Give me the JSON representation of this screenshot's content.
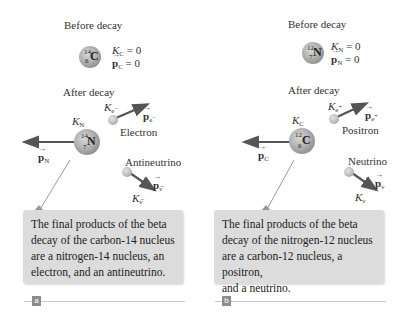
{
  "panels": [
    {
      "id": "a",
      "badge": "a",
      "before": {
        "heading": "Before decay",
        "nucleus": {
          "mass": "14",
          "z": "6",
          "element": "C"
        },
        "kinetic_symbol": "K",
        "kinetic_sub": "C",
        "kinetic_value": "= 0",
        "momentum_symbol": "p",
        "momentum_sub": "C",
        "momentum_value": "= 0"
      },
      "after": {
        "heading": "After decay",
        "nucleus": {
          "mass": "14",
          "z": "7",
          "element": "N"
        },
        "nucleus_kinetic": {
          "sym": "K",
          "sub": "N"
        },
        "nucleus_momentum": {
          "sym": "p",
          "sub": "N"
        },
        "particle1": {
          "name": "Electron",
          "kinetic": {
            "sym": "K",
            "sub": "e",
            "sup": "−"
          },
          "momentum": {
            "sym": "p",
            "sub": "e",
            "sup": "−"
          }
        },
        "particle2": {
          "name": "Antineutrino",
          "kinetic": {
            "sym": "K",
            "sub": "ν̅"
          },
          "momentum": {
            "sym": "p",
            "sub": "ν̅"
          }
        }
      },
      "caption": "The final products of the beta decay of the carbon-14 nucleus are a nitrogen-14 nucleus, an electron, and an antineutrino.",
      "caption_lines": [
        "The final products of the beta",
        "decay of the carbon-14 nucleus",
        "are a nitrogen-14 nucleus, an",
        "electron, and an antineutrino."
      ]
    },
    {
      "id": "b",
      "badge": "b",
      "before": {
        "heading": "Before decay",
        "nucleus": {
          "mass": "12",
          "z": "7",
          "element": "N"
        },
        "kinetic_symbol": "K",
        "kinetic_sub": "N",
        "kinetic_value": "= 0",
        "momentum_symbol": "p",
        "momentum_sub": "N",
        "momentum_value": "= 0"
      },
      "after": {
        "heading": "After decay",
        "nucleus": {
          "mass": "12",
          "z": "6",
          "element": "C"
        },
        "nucleus_kinetic": {
          "sym": "K",
          "sub": "C"
        },
        "nucleus_momentum": {
          "sym": "p",
          "sub": "C"
        },
        "particle1": {
          "name": "Positron",
          "kinetic": {
            "sym": "K",
            "sub": "e",
            "sup": "+"
          },
          "momentum": {
            "sym": "p",
            "sub": "e",
            "sup": "+"
          }
        },
        "particle2": {
          "name": "Neutrino",
          "kinetic": {
            "sym": "K",
            "sub": "ν"
          },
          "momentum": {
            "sym": "p",
            "sub": "ν"
          }
        }
      },
      "caption": "The final products of the beta decay of the nitrogen-12 nucleus are a carbon-12 nucleus, a positron, and a neutrino.",
      "caption_lines": [
        "The final products of the beta",
        "decay of the nitrogen-12 nucleus",
        "are a carbon-12 nucleus, a positron,",
        "and a neutrino."
      ]
    }
  ],
  "colors": {
    "callout_bg": "#dcdcdc",
    "arrow": "#555555",
    "badge_bg": "#8c8c8c",
    "rule": "#c8c8c8"
  }
}
